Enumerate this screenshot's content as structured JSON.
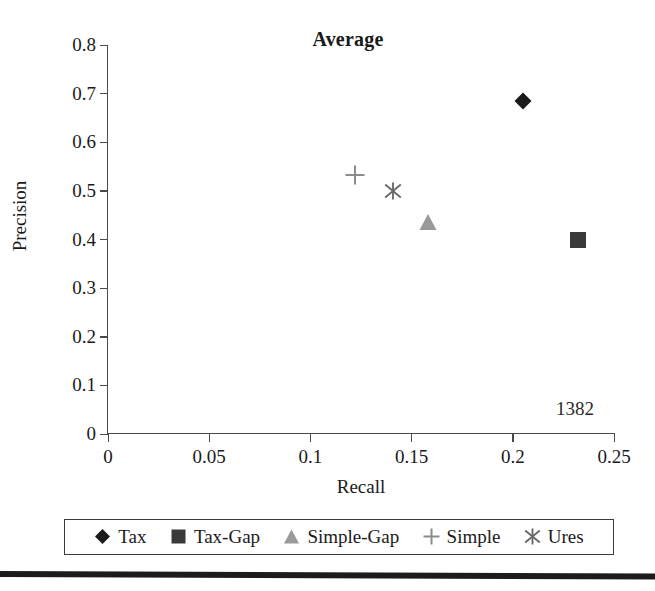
{
  "chart_data": {
    "type": "scatter",
    "title": "Average",
    "xlabel": "Recall",
    "ylabel": "Precision",
    "xlim": [
      0,
      0.25
    ],
    "ylim": [
      0,
      0.8
    ],
    "grid": false,
    "legend_position": "bottom",
    "xticks": [
      "0",
      "0.05",
      "0.1",
      "0.15",
      "0.2",
      "0.25"
    ],
    "xtick_values": [
      0,
      0.05,
      0.1,
      0.15,
      0.2,
      0.25
    ],
    "yticks": [
      "0",
      "0.1",
      "0.2",
      "0.3",
      "0.4",
      "0.5",
      "0.6",
      "0.7",
      "0.8"
    ],
    "ytick_values": [
      0,
      0.1,
      0.2,
      0.3,
      0.4,
      0.5,
      0.6,
      0.7,
      0.8
    ],
    "annotations": [
      {
        "text": "1382",
        "x": 0.232,
        "y": 0.072
      }
    ],
    "series": [
      {
        "name": "Tax",
        "marker": "diamond",
        "color": "#1a1a1a",
        "x": [
          0.205
        ],
        "y": [
          0.685
        ]
      },
      {
        "name": "Tax-Gap",
        "marker": "square",
        "color": "#3a3a3a",
        "x": [
          0.232
        ],
        "y": [
          0.4
        ]
      },
      {
        "name": "Simple-Gap",
        "marker": "triangle",
        "color": "#9a9a9a",
        "x": [
          0.158
        ],
        "y": [
          0.436
        ]
      },
      {
        "name": "Simple",
        "marker": "plus",
        "color": "#8c8c8c",
        "x": [
          0.122
        ],
        "y": [
          0.533
        ]
      },
      {
        "name": "Ures",
        "marker": "star",
        "color": "#6a6a6a",
        "x": [
          0.141
        ],
        "y": [
          0.5
        ]
      }
    ]
  },
  "figure": {
    "title": "Average",
    "annotation": "1382",
    "axis_x_title": "Recall",
    "axis_y_title": "Precision",
    "legend": [
      {
        "label": "Tax",
        "marker": "diamond"
      },
      {
        "label": "Tax-Gap",
        "marker": "square"
      },
      {
        "label": "Simple-Gap",
        "marker": "triangle"
      },
      {
        "label": "Simple",
        "marker": "plus"
      },
      {
        "label": "Ures",
        "marker": "star"
      }
    ]
  }
}
